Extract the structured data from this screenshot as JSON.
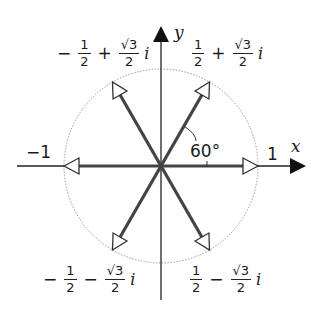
{
  "diagram": {
    "axes": {
      "x_label": "x",
      "y_label": "y",
      "x_tick_pos": "1",
      "x_tick_neg": "−1"
    },
    "angle_label": "60°",
    "unit_circle": {
      "style": "dotted-gray",
      "radius": 1
    },
    "roots": [
      {
        "position": "upper-right",
        "sign": "",
        "real_num": "1",
        "real_den": "2",
        "op": "+",
        "imag_num": "√3",
        "imag_den": "2",
        "i": "i",
        "angle_deg": 60
      },
      {
        "position": "upper-left",
        "sign": "−",
        "real_num": "1",
        "real_den": "2",
        "op": "+",
        "imag_num": "√3",
        "imag_den": "2",
        "i": "i",
        "angle_deg": 120
      },
      {
        "position": "lower-left",
        "sign": "−",
        "real_num": "1",
        "real_den": "2",
        "op": "−",
        "imag_num": "√3",
        "imag_den": "2",
        "i": "i",
        "angle_deg": 240
      },
      {
        "position": "lower-right",
        "sign": "",
        "real_num": "1",
        "real_den": "2",
        "op": "−",
        "imag_num": "√3",
        "imag_den": "2",
        "i": "i",
        "angle_deg": 300
      }
    ],
    "vectors_angles_deg": [
      0,
      60,
      120,
      180,
      240,
      300
    ],
    "colors": {
      "vector": "#444444",
      "axis": "#222222",
      "circle": "#9a9a9a",
      "text": "#1a1a1a"
    }
  }
}
